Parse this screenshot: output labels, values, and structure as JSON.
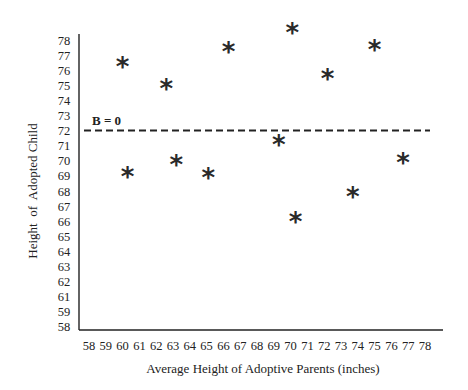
{
  "chart_data": {
    "type": "scatter",
    "title": "",
    "xlabel": "Average Height of Adoptive Parents (inches)",
    "ylabel": "Height  of  Adopted Child",
    "x_ticks": [
      58,
      59,
      60,
      61,
      62,
      63,
      64,
      65,
      66,
      67,
      68,
      69,
      70,
      71,
      72,
      73,
      74,
      75,
      76,
      77,
      78
    ],
    "y_ticks": [
      78,
      77,
      76,
      75,
      74,
      73,
      72,
      71,
      70,
      69,
      68,
      67,
      66,
      65,
      64,
      63,
      62,
      61,
      59,
      58
    ],
    "xlim": [
      58,
      78
    ],
    "ylim": [
      58,
      78
    ],
    "grid": false,
    "marker": "*",
    "points": [
      {
        "x": 60.0,
        "y": 76.5
      },
      {
        "x": 60.3,
        "y": 69.2
      },
      {
        "x": 62.6,
        "y": 75.0
      },
      {
        "x": 63.2,
        "y": 70.0
      },
      {
        "x": 65.1,
        "y": 69.1
      },
      {
        "x": 66.3,
        "y": 77.5
      },
      {
        "x": 69.3,
        "y": 71.3
      },
      {
        "x": 70.1,
        "y": 78.7
      },
      {
        "x": 70.3,
        "y": 66.2
      },
      {
        "x": 72.2,
        "y": 75.7
      },
      {
        "x": 73.7,
        "y": 67.9
      },
      {
        "x": 75.0,
        "y": 77.6
      },
      {
        "x": 76.7,
        "y": 70.1
      }
    ],
    "reference_line": {
      "label": "B = 0",
      "y": 72,
      "style": "dashed",
      "orientation": "horizontal"
    }
  }
}
